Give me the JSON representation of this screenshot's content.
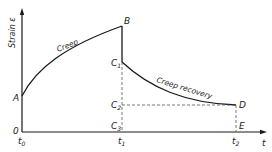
{
  "diagram": {
    "y_axis_label": "Strain ε",
    "x_axis_label": "t",
    "curve_labels": {
      "creep": "Creep",
      "recovery": "Creep recovery"
    },
    "points": {
      "A": "A",
      "B": "B",
      "C1": "C",
      "C1_sub": "1",
      "C2": "C",
      "C2_sub": "2",
      "C3": "C",
      "C3_sub": "3",
      "D": "D",
      "E": "E",
      "O": "0"
    },
    "ticks": {
      "t0": "t",
      "t0_sub": "0",
      "t1": "t",
      "t1_sub": "1",
      "t2": "t",
      "t2_sub": "2"
    },
    "colors": {
      "line": "#1a1a1a",
      "dashed": "#555555",
      "background": "#ffffff"
    }
  }
}
